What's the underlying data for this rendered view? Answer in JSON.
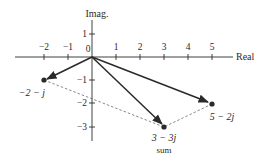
{
  "diagram": {
    "axes": {
      "x_label": "Real",
      "y_label": "Imag.",
      "x_ticks": [
        "−2",
        "−1",
        "0",
        "1",
        "2",
        "3",
        "4",
        "5"
      ],
      "x_tick_values": [
        -2,
        -1,
        0,
        1,
        2,
        3,
        4,
        5
      ],
      "y_ticks": [
        "1",
        "−1",
        "−2",
        "−3"
      ],
      "y_tick_values": [
        1,
        -1,
        -2,
        -3
      ]
    },
    "points": [
      {
        "id": "a",
        "re": -2,
        "im": -1,
        "label": "−2 − j"
      },
      {
        "id": "b",
        "re": 5,
        "im": -2,
        "label": "5 − 2j"
      },
      {
        "id": "sum",
        "re": 3,
        "im": -3,
        "label": "3 − 3j",
        "sublabel": "sum"
      }
    ],
    "vectors": [
      {
        "from": "origin",
        "to": "a",
        "style": "solid-arrow"
      },
      {
        "from": "origin",
        "to": "b",
        "style": "solid-arrow"
      },
      {
        "from": "origin",
        "to": "sum",
        "style": "solid-arrow"
      }
    ],
    "parallelogram_edges": [
      {
        "from": "a",
        "to": "sum",
        "style": "dashed"
      },
      {
        "from": "b",
        "to": "sum",
        "style": "dashed"
      }
    ],
    "colors": {
      "line": "#2a2a2a",
      "dashed": "#555555",
      "background": "#ffffff"
    }
  }
}
